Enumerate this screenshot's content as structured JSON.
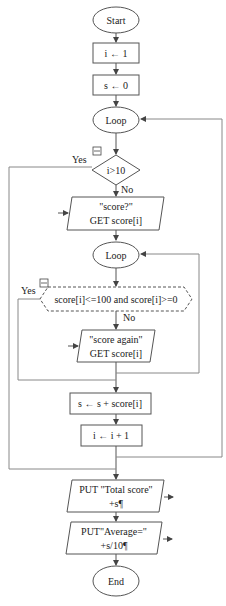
{
  "flowchart": {
    "start": "Start",
    "init_i": "i ← 1",
    "init_s": "s ← 0",
    "outer_loop": "Loop",
    "outer_condition": "i>10",
    "outer_yes": "Yes",
    "outer_no": "No",
    "input1_line1": "\"score?\"",
    "input1_line2": "GET score[i]",
    "inner_loop": "Loop",
    "inner_condition": "score[i]<=100 and score[i]>=0",
    "inner_yes": "Yes",
    "inner_no": "No",
    "input2_line1": "\"score again\"",
    "input2_line2": "GET score[i]",
    "accumulate": "s ← s + score[i]",
    "increment": "i ← i + 1",
    "output1_line1": "PUT \"Total score\"",
    "output1_line2": "+s¶",
    "output2_line1": "PUT\"Average=\"",
    "output2_line2": "+s/10¶",
    "end": "End"
  },
  "colors": {
    "stroke": "#555555",
    "connector": "#888888",
    "background": "#ffffff"
  }
}
